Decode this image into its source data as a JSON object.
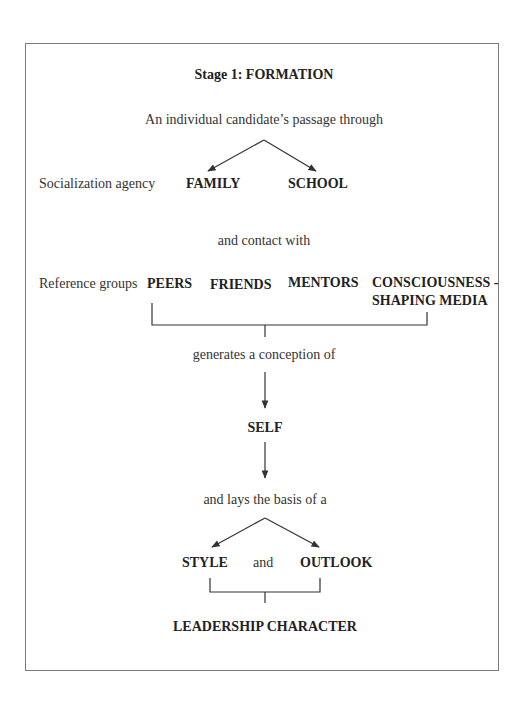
{
  "title": "Stage 1:  FORMATION",
  "intro": "An individual candidate’s passage through",
  "socialization": {
    "label": "Socialization agency",
    "items": [
      "FAMILY",
      "SCHOOL"
    ]
  },
  "contact": "and contact with",
  "reference": {
    "label": "Reference groups",
    "items": [
      "PEERS",
      "FRIENDS",
      "MENTORS"
    ],
    "media_line1": "CONSCIOUSNESS -",
    "media_line2": "SHAPING MEDIA"
  },
  "generates": "generates a conception of",
  "self": "SELF",
  "lays_basis": "and lays the basis of a",
  "outcome": {
    "left": "STYLE",
    "connector": "and",
    "right": "OUTLOOK"
  },
  "result": "LEADERSHIP CHARACTER",
  "colors": {
    "border": "#7a7a7a",
    "line": "#333333"
  }
}
